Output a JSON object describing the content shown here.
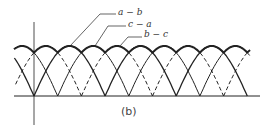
{
  "figure": {
    "caption": "(b)",
    "labels": [
      {
        "text": "a − b",
        "x": 118,
        "y": 7
      },
      {
        "text": "c − a",
        "x": 128,
        "y": 19
      },
      {
        "text": "b − c",
        "x": 144,
        "y": 29
      }
    ],
    "axis": {
      "baseline_y": 96,
      "vertical_x": 34,
      "x_start": 14,
      "x_end": 260,
      "v_top": 22,
      "v_bottom": 125
    },
    "arcs": {
      "first_cusp": 34,
      "spacing": 23.7,
      "count": 9,
      "span_periods": 3,
      "top_y": 46,
      "start_offset": -2
    },
    "colors": {
      "line": "#222222"
    }
  }
}
